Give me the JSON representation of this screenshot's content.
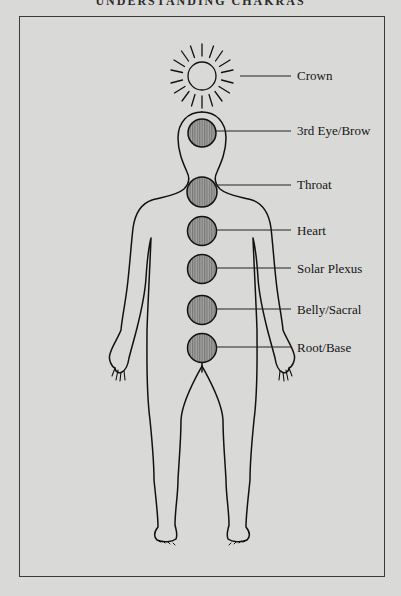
{
  "page": {
    "header": "UNDERSTANDING CHAKRAS"
  },
  "diagram": {
    "colors": {
      "background": "#d9d9d7",
      "line": "#111111",
      "chakra_fill": "#9a9a98"
    },
    "chakras": [
      {
        "name": "Crown",
        "y": 76,
        "icon": "sun-icon"
      },
      {
        "name": "3rd Eye/Brow",
        "y": 131,
        "icon": "circle-hatched"
      },
      {
        "name": "Throat",
        "y": 186,
        "icon": "circle-hatched"
      },
      {
        "name": "Heart",
        "y": 231,
        "icon": "circle-hatched"
      },
      {
        "name": "Solar Plexus",
        "y": 269,
        "icon": "circle-hatched"
      },
      {
        "name": "Belly/Sacral",
        "y": 310,
        "icon": "circle-hatched"
      },
      {
        "name": "Root/Base",
        "y": 348,
        "icon": "circle-hatched"
      }
    ]
  }
}
